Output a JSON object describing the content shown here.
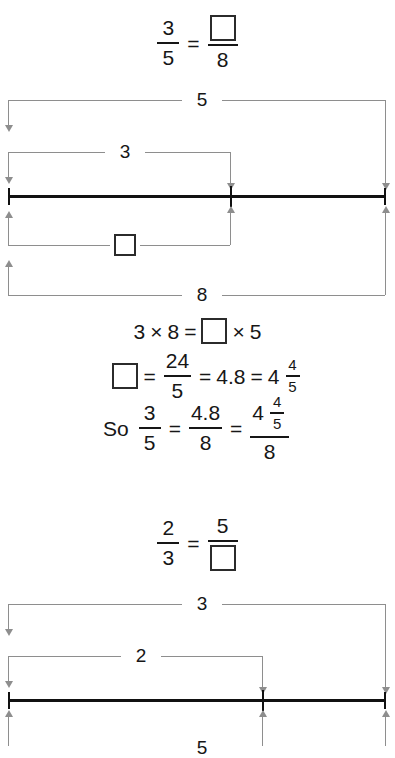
{
  "problems": [
    {
      "id": "problem-1",
      "statement": {
        "left_num": "3",
        "left_den": "5",
        "equals": "=",
        "right_num_box": "",
        "right_den": "8"
      },
      "diagram": {
        "top_bracket_label": "5",
        "upper_inner_label": "3",
        "lower_inner_label": "",
        "bottom_bracket_label": "8"
      },
      "steps": [
        {
          "id": "cross-multiply",
          "a": "3",
          "times1": "×",
          "b": "8",
          "equals": "=",
          "box": "",
          "times2": "×",
          "c": "5"
        },
        {
          "id": "solve-box",
          "box": "",
          "equals1": "=",
          "frac_num": "24",
          "frac_den": "5",
          "equals2": "=",
          "decimal": "4.8",
          "equals3": "=",
          "mixed_whole": "4",
          "mixed_num": "4",
          "mixed_den": "5"
        },
        {
          "id": "conclusion",
          "lead": "So",
          "f1_num": "3",
          "f1_den": "5",
          "equals1": "=",
          "f2_num": "4.8",
          "f2_den": "8",
          "equals2": "=",
          "f3_whole": "4",
          "f3_num": "4",
          "f3_den": "5",
          "f3_den_outer": "8"
        }
      ]
    },
    {
      "id": "problem-2",
      "statement": {
        "left_num": "2",
        "left_den": "3",
        "equals": "=",
        "right_num": "5",
        "right_den_box": ""
      },
      "diagram": {
        "top_bracket_label": "3",
        "upper_inner_label": "2",
        "bottom_bracket_label": "5"
      }
    }
  ],
  "colors": {
    "bar": "#111111",
    "bracket": "#8e8e8e",
    "text": "#161616",
    "background": "#ffffff"
  }
}
